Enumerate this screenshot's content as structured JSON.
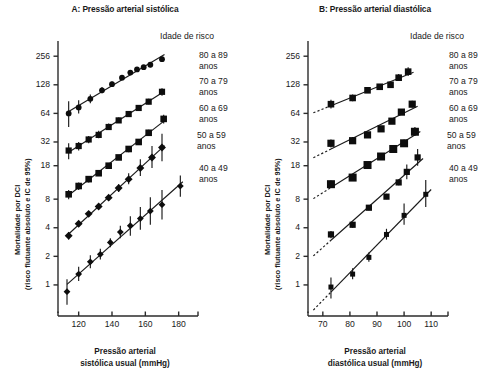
{
  "figure": {
    "legend_title": "Idade de risco",
    "age_groups": [
      {
        "label_line1": "80 a 89",
        "label_line2": "anos"
      },
      {
        "label_line1": "70 a 79",
        "label_line2": "anos"
      },
      {
        "label_line1": "60 a 69",
        "label_line2": "anos"
      },
      {
        "label_line1": "50 a 59",
        "label_line2": "anos"
      },
      {
        "label_line1": "40 a 49",
        "label_line2": "anos"
      }
    ],
    "ylabel_line1": "Mortalidade por DCI",
    "ylabel_line2": "(risco flutuante absoluto e IC de 95%)"
  },
  "chart_data": [
    {
      "type": "scatter",
      "panel": "A",
      "title": "A: Pressão arterial sistólica",
      "xlabel_line1": "Pressão arterial",
      "xlabel_line2": "sistólica usual (mmHg)",
      "ylabel": "Mortalidade por DCI (risco flutuante absoluto e IC de 95%)",
      "yscale": "log",
      "ylim": [
        0.6,
        320
      ],
      "yticks": [
        256,
        128,
        64,
        32,
        18,
        8,
        4,
        2,
        1
      ],
      "ytick_labels": [
        "256",
        "128",
        "64",
        "32",
        "18",
        "8",
        "4",
        "2",
        "1"
      ],
      "xlim": [
        110,
        188
      ],
      "xticks": [
        120,
        140,
        160,
        180
      ],
      "xtick_labels": [
        "120",
        "140",
        "160",
        "180"
      ],
      "grid": false,
      "legend_position": "right",
      "series": [
        {
          "name": "80 a 89 anos",
          "x": [
            114,
            120,
            127,
            134,
            140,
            146,
            151,
            155,
            159,
            163,
            170
          ],
          "y": [
            64,
            74,
            91,
            112,
            130,
            152,
            172,
            186,
            196,
            208,
            238
          ],
          "ci_low": [
            46,
            64,
            82,
            104,
            122,
            143,
            162,
            176,
            186,
            196,
            222
          ],
          "ci_high": [
            86,
            88,
            101,
            121,
            139,
            162,
            183,
            197,
            207,
            221,
            254
          ]
        },
        {
          "name": "70 a 79 anos",
          "x": [
            114,
            120,
            126,
            132,
            138,
            144,
            150,
            156,
            162,
            170
          ],
          "y": [
            26,
            29,
            34,
            38,
            46,
            54,
            63,
            73,
            85,
            108
          ],
          "ci_low": [
            21,
            26,
            31,
            35,
            43,
            51,
            59,
            69,
            80,
            98
          ],
          "ci_high": [
            31,
            32,
            37,
            42,
            50,
            58,
            68,
            78,
            91,
            118
          ]
        },
        {
          "name": "60 a 69 anos",
          "x": [
            114,
            120,
            126,
            132,
            138,
            144,
            150,
            156,
            162,
            171
          ],
          "y": [
            9,
            11,
            13,
            15,
            18,
            22,
            27,
            32,
            40,
            56
          ],
          "ci_low": [
            8,
            10,
            12,
            14,
            17,
            21,
            25,
            30,
            37,
            50
          ],
          "ci_high": [
            10,
            12,
            14,
            16,
            19,
            23,
            28,
            34,
            43,
            62
          ]
        },
        {
          "name": "50 a 59 anos",
          "x": [
            114,
            120,
            126,
            132,
            138,
            144,
            150,
            157,
            164,
            170
          ],
          "y": [
            3.3,
            4.4,
            5.6,
            6.7,
            8.3,
            10.5,
            13,
            17,
            22,
            28
          ],
          "ci_low": [
            3.0,
            4.1,
            5.2,
            6.3,
            7.8,
            9.5,
            11.5,
            14,
            17,
            20
          ],
          "ci_high": [
            3.6,
            4.7,
            6.0,
            7.1,
            8.8,
            11.5,
            15,
            21,
            29,
            39
          ]
        },
        {
          "name": "40 a 49 anos",
          "x": [
            113,
            120,
            127,
            133,
            139,
            145,
            151,
            157,
            163,
            170,
            181
          ],
          "y": [
            0.85,
            1.3,
            1.75,
            2.1,
            2.8,
            3.6,
            4.2,
            5.0,
            6.0,
            7.0,
            11.0
          ],
          "ci_low": [
            0.62,
            1.1,
            1.5,
            1.85,
            2.5,
            3.1,
            3.3,
            3.8,
            4.3,
            4.9,
            8.5
          ],
          "ci_high": [
            1.15,
            1.55,
            2.05,
            2.4,
            3.1,
            4.2,
            5.3,
            6.6,
            8.4,
            10.0,
            14.2
          ]
        }
      ]
    },
    {
      "type": "scatter",
      "panel": "B",
      "title": "B: Pressão arterial diastólica",
      "xlabel_line1": "Pressão arterial",
      "xlabel_line2": "diastólica usual (mmHg)",
      "ylabel": "Mortalidade por DCI (risco flutuante absoluto e IC de 95%)",
      "yscale": "log",
      "ylim": [
        0.6,
        320
      ],
      "yticks": [
        256,
        128,
        64,
        32,
        18,
        8,
        4,
        2,
        1
      ],
      "ytick_labels": [
        "256",
        "128",
        "64",
        "32",
        "18",
        "8",
        "4",
        "2",
        "1"
      ],
      "xlim": [
        66,
        114
      ],
      "xticks": [
        70,
        80,
        90,
        100,
        110
      ],
      "xtick_labels": [
        "70",
        "80",
        "90",
        "100",
        "110"
      ],
      "grid": false,
      "legend_position": "right",
      "series": [
        {
          "name": "80 a 89 anos",
          "x": [
            73,
            81,
            86.5,
            91,
            95,
            98,
            101.5
          ],
          "y": [
            80,
            93,
            112,
            122,
            128,
            152,
            176
          ],
          "ci_low": [
            72,
            86,
            105,
            115,
            121,
            140,
            158
          ],
          "ci_high": [
            89,
            101,
            120,
            130,
            136,
            166,
            196
          ]
        },
        {
          "name": "70 a 79 anos",
          "x": [
            73,
            81,
            86.5,
            91.5,
            95.5,
            99,
            103
          ],
          "y": [
            31,
            33,
            38,
            44,
            53,
            66,
            80
          ],
          "ci_low": [
            28,
            31,
            36,
            41,
            50,
            62,
            74
          ],
          "ci_high": [
            34,
            36,
            41,
            47,
            56,
            71,
            87
          ]
        },
        {
          "name": "60 a 69 anos",
          "x": [
            73,
            81,
            86.5,
            91.5,
            96,
            100,
            104
          ],
          "y": [
            11.5,
            13.5,
            18.3,
            22.5,
            27,
            31,
            41
          ],
          "ci_low": [
            10.5,
            12.6,
            17.3,
            21.2,
            25,
            28.5,
            37
          ],
          "ci_high": [
            12.6,
            14.5,
            19.4,
            24,
            29,
            34,
            46
          ]
        },
        {
          "name": "50 a 59 anos",
          "x": [
            73,
            81,
            87,
            93.5,
            98,
            101,
            105
          ],
          "y": [
            3.4,
            4.3,
            6.5,
            8.5,
            12.0,
            15.5,
            22
          ],
          "ci_low": [
            3.1,
            4.0,
            6.1,
            8.0,
            11.2,
            13.0,
            18
          ],
          "ci_high": [
            3.7,
            4.6,
            6.9,
            9.1,
            12.8,
            18.5,
            27
          ]
        },
        {
          "name": "40 a 49 anos",
          "x": [
            73,
            81,
            87,
            93.5,
            100,
            108
          ],
          "y": [
            0.95,
            1.3,
            1.95,
            3.4,
            5.4,
            9.0
          ],
          "ci_low": [
            0.72,
            1.15,
            1.75,
            3.0,
            4.3,
            6.6
          ],
          "ci_high": [
            1.2,
            1.5,
            2.2,
            3.9,
            7.2,
            12.7
          ]
        }
      ]
    }
  ]
}
